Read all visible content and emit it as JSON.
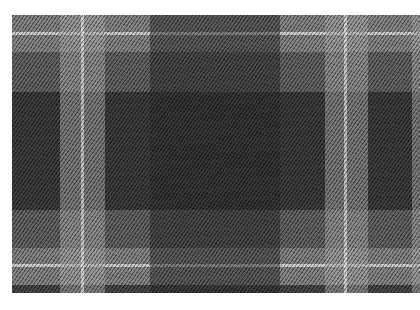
{
  "image": {
    "subject": "tartan plaid fabric",
    "description": "Grayscale tartan/plaid woven fabric with diagonal twill texture on white background",
    "palette": {
      "background": "#ffffff",
      "dark": "#2e2e2e",
      "darker_center": "#262626",
      "medium": "#5a5a5a",
      "light": "#8c8c8c",
      "lighter": "#a8a8a8",
      "white_stripe": "#e6e6e6"
    },
    "fabric_bounds": {
      "x": 12,
      "y": 15,
      "width": 408,
      "height": 278
    },
    "horizontal_bands": [
      {
        "top": 0,
        "height": 37,
        "color": "#858585",
        "opacity": 0.85
      },
      {
        "top": 37,
        "height": 40,
        "color": "#5a5a5a",
        "opacity": 0.85
      },
      {
        "top": 77,
        "height": 118,
        "color": "#2e2e2e",
        "opacity": 0.9
      },
      {
        "top": 195,
        "height": 38,
        "color": "#5a5a5a",
        "opacity": 0.85
      },
      {
        "top": 233,
        "height": 37,
        "color": "#858585",
        "opacity": 0.85
      },
      {
        "top": 270,
        "height": 8,
        "color": "#3a3a3a",
        "opacity": 0.9
      },
      {
        "top": 17,
        "height": 3,
        "color": "#e6e6e6",
        "opacity": 0.75
      },
      {
        "top": 249,
        "height": 3,
        "color": "#e6e6e6",
        "opacity": 0.75
      }
    ],
    "vertical_bands": [
      {
        "left": 48,
        "width": 45,
        "color": "#a0a0a0",
        "opacity": 0.55
      },
      {
        "left": 138,
        "width": 130,
        "color": "#1e1e1e",
        "opacity": 0.5
      },
      {
        "left": 313,
        "width": 43,
        "color": "#a0a0a0",
        "opacity": 0.55
      },
      {
        "left": 400,
        "width": 8,
        "color": "#a0a0a0",
        "opacity": 0.55
      },
      {
        "left": 69,
        "width": 3,
        "color": "#f0f0f0",
        "opacity": 0.6
      },
      {
        "left": 332,
        "width": 3,
        "color": "#f0f0f0",
        "opacity": 0.6
      }
    ]
  }
}
